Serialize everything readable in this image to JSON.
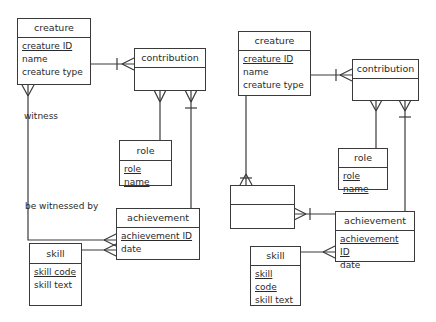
{
  "left_diagram": {
    "creature": {
      "title": "creature",
      "attributes": [
        "creature ID",
        "name",
        "creature type"
      ]
    },
    "contribution": {
      "title": "contribution"
    },
    "role": {
      "title": "role",
      "attributes": [
        "role name"
      ]
    },
    "achievement": {
      "title": "achievement",
      "attributes": [
        "achievement ID",
        "date"
      ]
    },
    "skill": {
      "title": "skill",
      "attributes": [
        "skill code",
        "skill text"
      ]
    },
    "labels": {
      "witness": "witness",
      "be_witnessed_by": "be witnessed by"
    }
  },
  "right_diagram": {
    "creature": {
      "title": "creature",
      "attributes": [
        "creature ID",
        "name",
        "creature type"
      ]
    },
    "contribution": {
      "title": "contribution"
    },
    "role": {
      "title": "role",
      "attributes": [
        "role name"
      ]
    },
    "achievement": {
      "title": "achievement",
      "attributes": [
        "achievement ID",
        "date"
      ]
    },
    "skill": {
      "title": "skill",
      "attributes": [
        "skill code",
        "skill text"
      ]
    },
    "unnamed_entity": {
      "title": ""
    }
  }
}
